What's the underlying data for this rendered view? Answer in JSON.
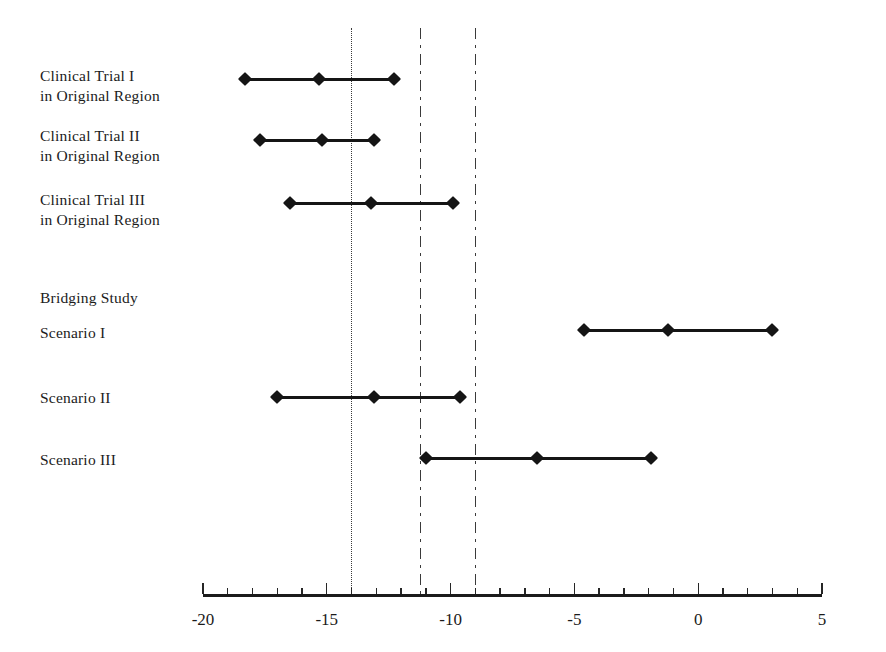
{
  "chart_data": {
    "type": "line",
    "title": "",
    "xlabel": "",
    "ylabel": "",
    "xlim": [
      -20,
      5
    ],
    "grid": false,
    "legend": "none",
    "orientation": "horizontal-interval",
    "x_ticks_major": [
      -20,
      -15,
      -10,
      -5,
      0,
      5
    ],
    "x_tick_labels": [
      "-20",
      "-15",
      "-10",
      "-5",
      "0",
      "5"
    ],
    "x_ticks_minor": [
      -19,
      -18,
      -17,
      -16,
      -14,
      -13,
      -12,
      -11,
      -9,
      -8,
      -7,
      -6,
      -4,
      -3,
      -2,
      -1,
      1,
      2,
      3,
      4
    ],
    "reference_lines": [
      {
        "value": -14.0,
        "style": "dotted",
        "name": "reference-line-dotted"
      },
      {
        "value": -11.2,
        "style": "dash-dot",
        "name": "reference-line-dashdot-left"
      },
      {
        "value": -9.0,
        "style": "dash-dot",
        "name": "reference-line-dashdot-right"
      }
    ],
    "categories": [
      "Clinical Trial I\nin Original Region",
      "Clinical Trial II\nin Original Region",
      "Clinical Trial III\nin Original Region",
      "Bridging Study\n\nScenario I",
      "Scenario II",
      "Scenario III"
    ],
    "rows": [
      {
        "label": "Clinical Trial I\nin Original Region",
        "name": "clinical-trial-1",
        "lower": -18.3,
        "estimate": -15.3,
        "upper": -12.3
      },
      {
        "label": "Clinical Trial II\nin Original Region",
        "name": "clinical-trial-2",
        "lower": -17.7,
        "estimate": -15.2,
        "upper": -13.1
      },
      {
        "label": "Clinical Trial III\nin Original Region",
        "name": "clinical-trial-3",
        "lower": -16.5,
        "estimate": -13.2,
        "upper": -9.9
      },
      {
        "label": "Bridging Study\n\nScenario I",
        "name": "bridging-study-scenario-1",
        "lower": -4.6,
        "estimate": -1.2,
        "upper": 3.0
      },
      {
        "label": "Scenario II",
        "name": "bridging-study-scenario-2",
        "lower": -17.0,
        "estimate": -13.1,
        "upper": -9.6
      },
      {
        "label": "Scenario III",
        "name": "bridging-study-scenario-3",
        "lower": -11.0,
        "estimate": -6.5,
        "upper": -1.9
      }
    ]
  },
  "colors": {
    "series": "#151515",
    "axis": "#1b1b1b",
    "reference": "#3a3a3a",
    "background": "#ffffff"
  },
  "labels": {
    "row_0": "Clinical Trial I\nin Original Region",
    "row_1": "Clinical Trial II\nin Original Region",
    "row_2": "Clinical Trial III\nin Original Region",
    "row_3": "Bridging Study",
    "row_3b": "Scenario I",
    "row_4": "Scenario II",
    "row_5": "Scenario III"
  },
  "axis": {
    "tick_0": "-20",
    "tick_1": "-15",
    "tick_2": "-10",
    "tick_3": "-5",
    "tick_4": "0",
    "tick_5": "5"
  }
}
